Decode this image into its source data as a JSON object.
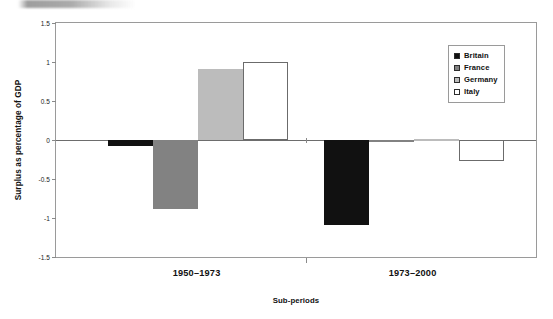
{
  "chart_data": {
    "type": "bar",
    "title": "",
    "xlabel": "Sub-periods",
    "ylabel": "Surplus as percentage of GDP",
    "categories": [
      "1950–1973",
      "1973–2000"
    ],
    "series": [
      {
        "name": "Britain",
        "color": "#111111",
        "values": [
          -0.08,
          -1.09
        ]
      },
      {
        "name": "France",
        "color": "#828282",
        "values": [
          -0.89,
          -0.02
        ]
      },
      {
        "name": "Germany",
        "color": "#bcbcbc",
        "values": [
          0.91,
          0.01
        ]
      },
      {
        "name": "Italy",
        "color": "#ffffff",
        "values": [
          1.0,
          -0.27
        ]
      }
    ],
    "ylim": [
      -1.5,
      1.5
    ],
    "yticks": [
      1.5,
      1,
      0.5,
      0,
      -0.5,
      -1,
      -1.5
    ],
    "ytick_labels": [
      "1.5",
      "1",
      "0.5",
      "0",
      "-0.5",
      "-1",
      "-1.5"
    ],
    "grid": false,
    "legend_position": "top-right",
    "zero_line": true
  },
  "legend": {
    "items": [
      {
        "label": "Britain",
        "color": "#111111"
      },
      {
        "label": "France",
        "color": "#828282"
      },
      {
        "label": "Germany",
        "color": "#bcbcbc"
      },
      {
        "label": "Italy",
        "color": "#ffffff"
      }
    ]
  },
  "axes": {
    "y_title": "Surplus as percentage of GDP",
    "x_title": "Sub-periods",
    "y_labels": [
      "1.5",
      "1",
      "0.5",
      "0",
      "-0.5",
      "-1",
      "-1.5"
    ],
    "x_labels": [
      "1950–1973",
      "1973–2000"
    ]
  },
  "colors": {
    "frame": "#9a9a9a",
    "zero_line": "#6d6d6d",
    "bar_outline": "#6b6b6b",
    "text": "#111111"
  }
}
